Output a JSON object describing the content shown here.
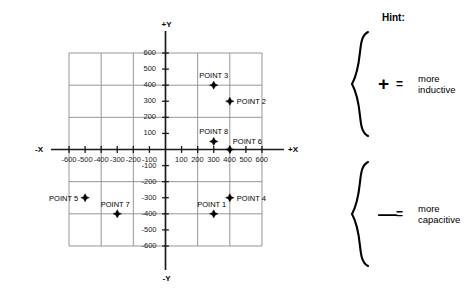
{
  "chart_data": {
    "type": "scatter",
    "title": "",
    "xlabel": "+X",
    "xlabel_neg": "-X",
    "ylabel": "+Y",
    "ylabel_neg": "-Y",
    "xlim": [
      -600,
      600
    ],
    "ylim": [
      -600,
      600
    ],
    "grid": true,
    "grid_step": 200,
    "tick_step": 100,
    "xticks": [
      -600,
      -500,
      -400,
      -300,
      -200,
      -100,
      100,
      200,
      300,
      400,
      500,
      600
    ],
    "xticklabels": [
      "-600",
      "-500",
      "-400",
      "-300",
      "-200",
      "-100",
      "100",
      "200",
      "300",
      "400",
      "500",
      "600"
    ],
    "yticks": [
      600,
      500,
      400,
      300,
      200,
      100,
      -100,
      -200,
      -300,
      -400,
      -500,
      -600
    ],
    "yticklabels": [
      "600",
      "500",
      "400",
      "300",
      "200",
      "100",
      "-100",
      "-200",
      "-300",
      "-400",
      "-500",
      "-600"
    ],
    "legend": "none",
    "points": [
      {
        "label": "POINT 1",
        "x": 300,
        "y": -400,
        "label_pos": "above-left"
      },
      {
        "label": "POINT 2",
        "x": 400,
        "y": 300,
        "label_pos": "right"
      },
      {
        "label": "POINT 3",
        "x": 300,
        "y": 400,
        "label_pos": "above"
      },
      {
        "label": "POINT 4",
        "x": 400,
        "y": -300,
        "label_pos": "right"
      },
      {
        "label": "POINT 5",
        "x": -500,
        "y": -300,
        "label_pos": "left"
      },
      {
        "label": "POINT 6",
        "x": 400,
        "y": 0,
        "label_pos": "above-right"
      },
      {
        "label": "POINT 7",
        "x": -300,
        "y": -400,
        "label_pos": "above-left"
      },
      {
        "label": "POINT 8",
        "x": 300,
        "y": 50,
        "label_pos": "above"
      }
    ]
  },
  "hint": {
    "title": "Hint:",
    "rows": [
      {
        "sign": "+",
        "equals": "=",
        "line1": "more",
        "line2": "inductive"
      },
      {
        "sign": "—",
        "equals": "=",
        "line1": "more",
        "line2": "capacitive"
      }
    ]
  },
  "colors": {
    "axis": "#1a1a1a",
    "grid": "#8a8a8a",
    "marker": "#000000",
    "text": "#000000",
    "background": "#ffffff"
  }
}
